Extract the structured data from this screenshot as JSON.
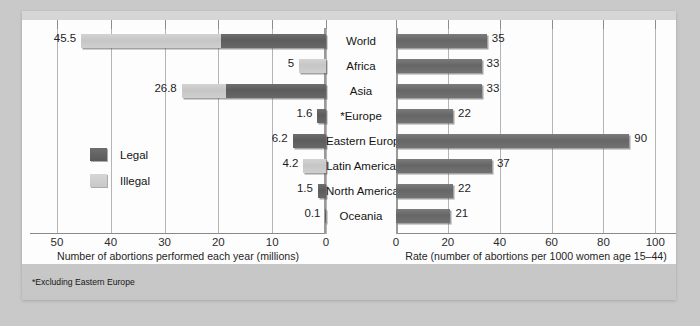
{
  "figure": {
    "footnote": "*Excluding Eastern Europe"
  },
  "legend": {
    "items": [
      {
        "label": "Legal",
        "key": "legal",
        "color": "#5c5c5c"
      },
      {
        "label": "Illegal",
        "key": "illegal",
        "color": "#cccccc"
      }
    ]
  },
  "categories": [
    "World",
    "Africa",
    "Asia",
    "*Europe",
    "Eastern Europe",
    "Latin America",
    "North America",
    "Oceania"
  ],
  "chart_data": [
    {
      "id": "abortions-millions",
      "type": "bar",
      "orientation": "horizontal",
      "stacked": true,
      "reversed_axis": true,
      "title": "",
      "xlabel": "Number of abortions performed each year (millions)",
      "ylabel": "",
      "xlim": [
        0,
        55
      ],
      "ticks": [
        50,
        40,
        30,
        20,
        10,
        0
      ],
      "grid": true,
      "legend_position": "inside-left",
      "categories": [
        "World",
        "Africa",
        "Asia",
        "*Europe",
        "Eastern Europe",
        "Latin America",
        "North America",
        "Oceania"
      ],
      "series": [
        {
          "name": "Legal",
          "values": [
            19.5,
            0,
            18.5,
            1.6,
            6.2,
            0,
            1.5,
            0.1
          ]
        },
        {
          "name": "Illegal",
          "values": [
            26.0,
            5.0,
            8.3,
            0,
            0,
            4.2,
            0,
            0
          ]
        }
      ],
      "totals": [
        45.5,
        5,
        26.8,
        1.6,
        6.2,
        4.2,
        1.5,
        0.1
      ],
      "labels": [
        "45.5",
        "5",
        "26.8",
        "1.6",
        "6.2",
        "4.2",
        "1.5",
        "0.1"
      ]
    },
    {
      "id": "abortion-rate",
      "type": "bar",
      "orientation": "horizontal",
      "stacked": false,
      "reversed_axis": false,
      "title": "",
      "xlabel": "Rate (number of abortions per 1000 women age 15–44)",
      "ylabel": "",
      "xlim": [
        0,
        108
      ],
      "ticks": [
        0,
        20,
        40,
        60,
        80,
        100
      ],
      "grid": true,
      "categories": [
        "World",
        "Africa",
        "Asia",
        "*Europe",
        "Eastern Europe",
        "Latin America",
        "North America",
        "Oceania"
      ],
      "values": [
        35,
        33,
        33,
        22,
        90,
        37,
        22,
        21
      ],
      "labels": [
        "35",
        "33",
        "33",
        "22",
        "90",
        "37",
        "22",
        "21"
      ]
    }
  ]
}
